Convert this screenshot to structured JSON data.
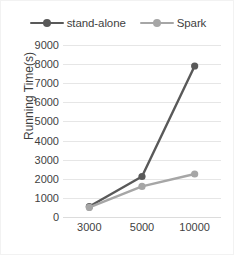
{
  "chart_data": {
    "type": "line",
    "title": "",
    "xlabel": "",
    "ylabel": "Running Time(s)",
    "categories": [
      "3000",
      "5000",
      "10000"
    ],
    "series": [
      {
        "name": "stand-alone",
        "values": [
          550,
          2120,
          7900
        ],
        "color": "#595959",
        "marker": "circle"
      },
      {
        "name": "Spark",
        "values": [
          500,
          1600,
          2250
        ],
        "color": "#a6a6a6",
        "marker": "circle"
      }
    ],
    "ylim": [
      0,
      9000
    ],
    "ytick_step": 1000,
    "yticks": [
      "9000",
      "8000",
      "7000",
      "6000",
      "5000",
      "4000",
      "3000",
      "2000",
      "1000",
      "0"
    ],
    "grid": true,
    "grid_axis": "y",
    "legend_position": "top",
    "plot_background": "#ffffff",
    "gridline_color": "#e6e6e6",
    "text_color": "#3f3f3f"
  },
  "legend": {
    "items": [
      {
        "label": "stand-alone",
        "color": "#595959"
      },
      {
        "label": "Spark",
        "color": "#a6a6a6"
      }
    ]
  }
}
